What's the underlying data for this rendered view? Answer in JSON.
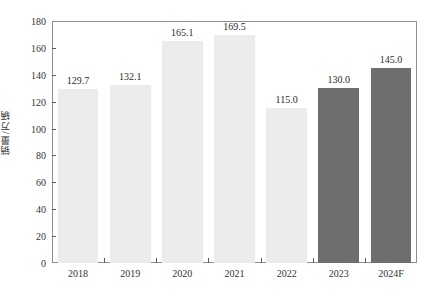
{
  "chart_data": {
    "type": "bar",
    "title": "",
    "xlabel": "",
    "ylabel": "销量/万辆",
    "categories": [
      "2018",
      "2019",
      "2020",
      "2021",
      "2022",
      "2023",
      "2024F"
    ],
    "values": [
      129.7,
      132.1,
      165.1,
      169.5,
      115.0,
      130.0,
      145.0
    ],
    "value_labels": [
      "129.7",
      "132.1",
      "165.1",
      "169.5",
      "115.0",
      "130.0",
      "145.0"
    ],
    "bar_styles": [
      "light",
      "light",
      "light",
      "light",
      "light",
      "dark",
      "dark"
    ],
    "ylim": [
      0,
      180
    ],
    "ytick_values": [
      0,
      20,
      40,
      60,
      80,
      100,
      120,
      140,
      160,
      180
    ],
    "ytick_labels": [
      "0",
      "20",
      "40",
      "60",
      "80",
      "100",
      "120",
      "140",
      "160",
      "180"
    ],
    "grid": false,
    "legend": null,
    "colors": {
      "bar_light": "#ececec",
      "bar_dark": "#6e6e6e",
      "axis": "#8d8d8d",
      "text": "#2b2b2b",
      "background": "#ffffff"
    }
  },
  "clipped_header_text": ""
}
